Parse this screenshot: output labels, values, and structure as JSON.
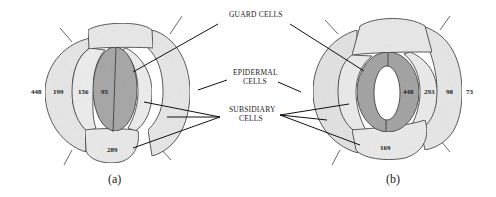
{
  "labels": {
    "guard_cells": "GUARD CELLS",
    "epidermal_line1": "EPIDERMAL",
    "epidermal_line2": "CELLS",
    "subsidiary_line1": "SUBSIDIARY",
    "subsidiary_line2": "CELLS"
  },
  "panel_a": {
    "caption": "(a)",
    "values": {
      "outer_left": "448",
      "mid_left": "199",
      "inner_left": "156",
      "guard": "95",
      "bottom": "289"
    }
  },
  "panel_b": {
    "caption": "(b)",
    "values": {
      "guard": "448",
      "inner_right": "293",
      "mid_right": "98",
      "outer_right": "73",
      "bottom": "169"
    }
  },
  "colors": {
    "outer_cells": "#e6e6e6",
    "subsidiary_cells": "#ececec",
    "guard_cells": "#a8a8a8",
    "pore": "#ffffff",
    "outline": "#333333"
  }
}
